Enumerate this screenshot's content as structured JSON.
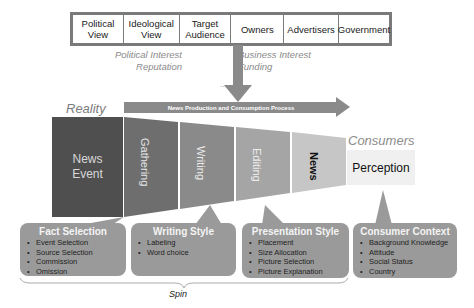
{
  "influences": {
    "factors": [
      "Political View",
      "Ideological View",
      "Target Audience",
      "Owners",
      "Advertisers",
      "Government"
    ],
    "left_interests": [
      "Political Interest",
      "Reputation"
    ],
    "right_interests": [
      "Business Interest",
      "Funding"
    ],
    "ellipsis": "..."
  },
  "labels": {
    "reality": "Reality",
    "consumers": "Consumers",
    "process": "News Production and Consumption Process",
    "spin": "Spin"
  },
  "pipeline": {
    "news_event": "News Event",
    "stages": [
      "Gathering",
      "Writing",
      "Editing",
      "News"
    ],
    "perception": "Perception"
  },
  "boxes": [
    {
      "title": "Fact Selection",
      "items": [
        "Event Selection",
        "Source Selection",
        "Commission",
        "Omission"
      ]
    },
    {
      "title": "Writing Style",
      "items": [
        "Labeling",
        "Word choice"
      ]
    },
    {
      "title": "Presentation Style",
      "items": [
        "Placement",
        "Size Allocation",
        "Picture Selection",
        "Picture Explanation"
      ]
    },
    {
      "title": "Consumer Context",
      "items": [
        "Background Knowledge",
        "Attitude",
        "Social Status",
        "Country"
      ]
    }
  ],
  "colors": {
    "news_event": "#4f4f4f",
    "gathering": "#6e6e6e",
    "writing": "#8a8a8a",
    "editing": "#a3a3a3",
    "news": "#c4c4c4",
    "perception": "#f0f0f0",
    "box": "#9a9a9a",
    "arrow": "#8a8a8a"
  }
}
